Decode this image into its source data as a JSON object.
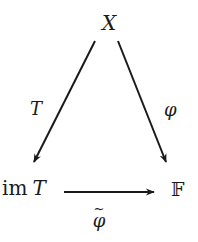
{
  "diagram": {
    "type": "commutative-diagram",
    "nodes": {
      "top": {
        "label": "X"
      },
      "bottom_left": {
        "label_prefix": "im",
        "label_var": "T"
      },
      "bottom_right": {
        "label": "𝔽"
      }
    },
    "arrows": {
      "left": {
        "from": "X",
        "to": "im T",
        "label": "T"
      },
      "right": {
        "from": "X",
        "to": "𝔽",
        "label": "φ"
      },
      "bottom": {
        "from": "im T",
        "to": "𝔽",
        "label": "φ",
        "label_accent": "~"
      }
    },
    "colors": {
      "ink": "#1a1a1a",
      "background": "#ffffff"
    }
  }
}
